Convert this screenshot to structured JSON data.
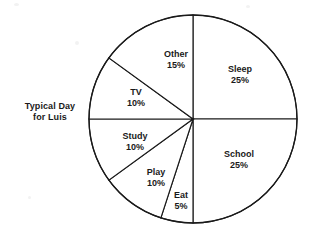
{
  "caption": {
    "line1": "Typical Day",
    "line2": "for Luis"
  },
  "chart_data": {
    "type": "pie",
    "title": "Typical Day for Luis",
    "subtitle": "",
    "xlabel": "",
    "ylabel": "",
    "units": "percent",
    "total": 100,
    "start_angle_deg": 90,
    "direction": "clockwise",
    "legend": "none",
    "grid": false,
    "labels_inside_slices": true,
    "slice_fill": "#ffffff",
    "slice_stroke": "#1a1a1a",
    "categories": [
      "Sleep",
      "School",
      "Eat",
      "Play",
      "Study",
      "TV",
      "Other"
    ],
    "values": [
      25,
      25,
      5,
      10,
      10,
      10,
      15
    ],
    "slices": [
      {
        "name": "Sleep",
        "value": 25,
        "pct_text": "25%",
        "label_x": 240,
        "label_y": 75,
        "start_deg": 0,
        "end_deg": 90
      },
      {
        "name": "School",
        "value": 25,
        "pct_text": "25%",
        "label_x": 239,
        "label_y": 160,
        "start_deg": 90,
        "end_deg": 180
      },
      {
        "name": "Eat",
        "value": 5,
        "pct_text": "5%",
        "label_x": 181,
        "label_y": 201,
        "start_deg": 180,
        "end_deg": 198
      },
      {
        "name": "Play",
        "value": 10,
        "pct_text": "10%",
        "label_x": 156,
        "label_y": 178,
        "start_deg": 198,
        "end_deg": 234
      },
      {
        "name": "Study",
        "value": 10,
        "pct_text": "10%",
        "label_x": 135,
        "label_y": 142,
        "start_deg": 234,
        "end_deg": 270
      },
      {
        "name": "TV",
        "value": 10,
        "pct_text": "10%",
        "label_x": 136,
        "label_y": 98,
        "start_deg": 270,
        "end_deg": 306
      },
      {
        "name": "Other",
        "value": 15,
        "pct_text": "15%",
        "label_x": 176,
        "label_y": 60,
        "start_deg": 306,
        "end_deg": 360
      }
    ],
    "geometry": {
      "center_x": 193,
      "center_y": 119,
      "radius": 104
    }
  }
}
